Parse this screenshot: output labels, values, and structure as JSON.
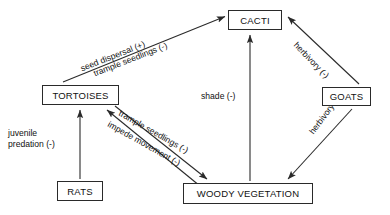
{
  "diagram": {
    "type": "signed-directed-graph",
    "background_color": "#ffffff",
    "stroke_color": "#2a2a2a",
    "text_color": "#111111"
  },
  "nodes": [
    {
      "id": "cacti",
      "label": "CACTI",
      "x": 228,
      "y": 10,
      "w": 54,
      "h": 20
    },
    {
      "id": "tortoises",
      "label": "TORTOISES",
      "x": 42,
      "y": 85,
      "w": 77,
      "h": 20
    },
    {
      "id": "goats",
      "label": "GOATS",
      "x": 322,
      "y": 87,
      "w": 49,
      "h": 19
    },
    {
      "id": "rats",
      "label": "RATS",
      "x": 57,
      "y": 181,
      "w": 46,
      "h": 20
    },
    {
      "id": "woody",
      "label": "WOODY VEGETATION",
      "x": 183,
      "y": 183,
      "w": 130,
      "h": 21
    }
  ],
  "edges": [
    {
      "id": "tortoises-cacti",
      "from": "tortoises",
      "to": "cacti",
      "labels": [
        "seed dispersal (+)",
        "trample seedlings (-)"
      ],
      "signs": [
        "+",
        "-"
      ]
    },
    {
      "id": "goats-cacti",
      "from": "goats",
      "to": "cacti",
      "labels": [
        "herbivory (-)"
      ],
      "signs": [
        "-"
      ]
    },
    {
      "id": "woody-cacti",
      "from": "woody",
      "to": "cacti",
      "labels": [
        "shade (-)"
      ],
      "signs": [
        "-"
      ]
    },
    {
      "id": "tortoises-woody",
      "from": "tortoises",
      "to": "woody",
      "labels": [
        "trample seedlings (-)"
      ],
      "signs": [
        "-"
      ]
    },
    {
      "id": "woody-tortoises",
      "from": "woody",
      "to": "tortoises",
      "labels": [
        "impede movement (-)"
      ],
      "signs": [
        "-"
      ]
    },
    {
      "id": "goats-woody",
      "from": "goats",
      "to": "woody",
      "labels": [
        "herbivory (-)"
      ],
      "signs": [
        "-"
      ]
    },
    {
      "id": "rats-tortoises",
      "from": "rats",
      "to": "tortoises",
      "labels": [
        "juvenile",
        "predation (-)"
      ],
      "signs": [
        "-"
      ]
    }
  ],
  "labels": {
    "seed_dispersal": "seed dispersal (+)",
    "trample_seedlings_cacti": "trample seedlings (-)",
    "herbivory_cacti": "herbivory (-)",
    "shade": "shade (-)",
    "trample_seedlings_woody": "trample seedlings (-)",
    "impede_movement": "impede movement (-)",
    "herbivory_woody": "herbivory (-)",
    "juvenile_line1": "juvenile",
    "juvenile_line2": "predation (-)"
  }
}
